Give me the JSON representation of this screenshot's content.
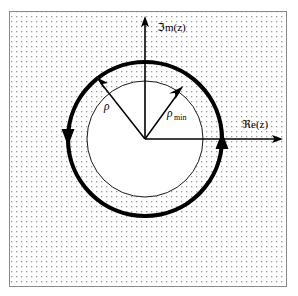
{
  "figure": {
    "type": "complex-plane-diagram",
    "background_color": "#ffffff",
    "frame_color": "#8a8a8a",
    "stipple_color": "#9a9a9a",
    "ink_color": "#000000"
  },
  "axes": {
    "real": {
      "label": "ℜe(z)",
      "label_plain": "Re(z)",
      "direction": "right",
      "arrow": "arrow-right"
    },
    "imaginary": {
      "label": "ℑm(z)",
      "label_plain": "Im(z)",
      "direction": "up",
      "arrow": "arrow-up"
    },
    "origin_x": 145,
    "origin_y": 139
  },
  "circles": {
    "inner": {
      "name": "rho-min-circle",
      "label": "ρ",
      "label_sub": "min",
      "radius_px": 58,
      "stroke_width": 1,
      "style": "thin",
      "fill": "#ffffff"
    },
    "outer": {
      "name": "contour-circle",
      "label": "ρ",
      "label_sub": "",
      "radius_px": 77,
      "stroke_width": 4.2,
      "style": "thick",
      "orientation": "counterclockwise"
    }
  },
  "radii": [
    {
      "name": "rho-arrow",
      "label": "ρ",
      "subscript": "",
      "angle_deg": 127,
      "length_px": 77,
      "target": "outer-contour-circle",
      "label_x": 109,
      "label_y": 105
    },
    {
      "name": "rho-min-arrow",
      "label": "ρ",
      "subscript": "min",
      "angle_deg": 55,
      "length_px": 58,
      "target": "inner-circle",
      "label_x": 172,
      "label_y": 111
    }
  ],
  "contour_arrows": [
    {
      "name": "contour-arrow-left",
      "position": "left",
      "points": "down",
      "angle_deg": 180,
      "x": 69,
      "y": 133
    },
    {
      "name": "contour-arrow-right",
      "position": "right",
      "points": "up",
      "angle_deg": 0,
      "x": 221,
      "y": 147
    }
  ],
  "region": {
    "name": "region-of-convergence",
    "fill_pattern": "stipple-dots",
    "description": "shaded exterior region"
  }
}
